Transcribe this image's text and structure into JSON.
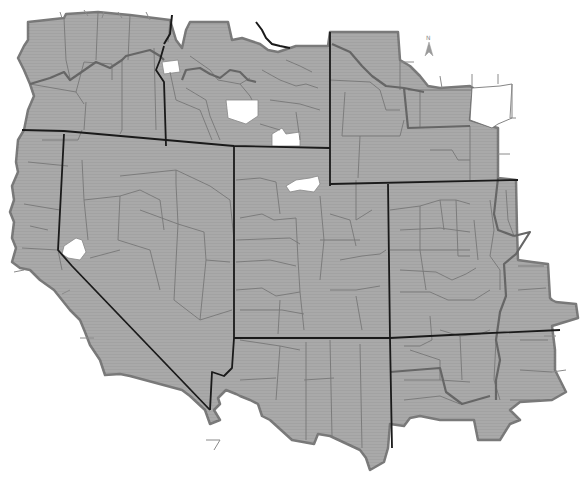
{
  "map": {
    "type": "choropleth-grayscale",
    "description": "Western United States with county boundaries, state borders",
    "colors": {
      "background": "#ffffff",
      "fill": "#a9a9a9",
      "county_border": "#777777",
      "state_border": "#1a1a1a",
      "excluded_area": "#ffffff"
    },
    "north_arrow": {
      "label": "N",
      "icon": "north-arrow-icon"
    }
  }
}
